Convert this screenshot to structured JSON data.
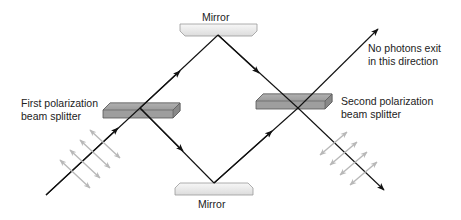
{
  "diagram": {
    "labels": {
      "mirror_top": "Mirror",
      "mirror_bottom": "Mirror",
      "first_splitter_line1": "First polarization",
      "first_splitter_line2": "beam splitter",
      "second_splitter_line1": "Second polarization",
      "second_splitter_line2": "beam splitter",
      "no_photons_line1": "No photons exit",
      "no_photons_line2": "in this direction"
    },
    "components": [
      {
        "type": "beam-splitter",
        "name": "First polarization beam splitter"
      },
      {
        "type": "mirror",
        "name": "Top mirror"
      },
      {
        "type": "mirror",
        "name": "Bottom mirror"
      },
      {
        "type": "beam-splitter",
        "name": "Second polarization beam splitter"
      }
    ],
    "colors": {
      "beam": "#111111",
      "polarization_arrows": "#b8b8b8",
      "splitter_fill": "#9a9a9a",
      "mirror_fill": "#eeeeee"
    }
  }
}
